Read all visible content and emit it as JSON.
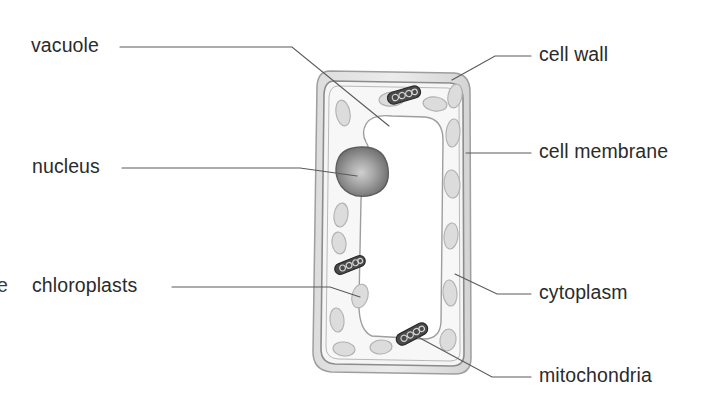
{
  "figure": {
    "style": "hand-drawn pencil biology diagram, grayscale",
    "background_color": "#ffffff",
    "text_color": "#2b2b2b",
    "line_color": "#5a5a5a"
  },
  "clipped_text": {
    "left_edge_fragment": "e"
  },
  "labels": [
    {
      "id": "vacuole",
      "text": "vacuole",
      "side": "left",
      "x": 31,
      "y": 36,
      "leader_from": [
        120,
        47
      ],
      "leader_to": [
        389,
        126
      ]
    },
    {
      "id": "nucleus",
      "text": "nucleus",
      "side": "left",
      "x": 32,
      "y": 157,
      "leader_from": [
        122,
        168
      ],
      "leader_to": [
        352,
        172
      ]
    },
    {
      "id": "chloroplasts",
      "text": "chloroplasts",
      "side": "left",
      "x": 32,
      "y": 276,
      "leader_from": [
        172,
        287
      ],
      "leader_to": [
        360,
        297
      ]
    },
    {
      "id": "cell-wall",
      "text": "cell wall",
      "side": "right",
      "x": 539,
      "y": 45,
      "leader_from": [
        531,
        56
      ],
      "leader_to": [
        455,
        78
      ]
    },
    {
      "id": "cell-membrane",
      "text": "cell membrane",
      "side": "right",
      "x": 539,
      "y": 142,
      "leader_from": [
        531,
        153
      ],
      "leader_to": [
        466,
        153
      ]
    },
    {
      "id": "cytoplasm",
      "text": "cytoplasm",
      "side": "right",
      "x": 539,
      "y": 283,
      "leader_from": [
        531,
        294
      ],
      "leader_to": [
        455,
        274
      ]
    },
    {
      "id": "mitochondria",
      "text": "mitochondria",
      "side": "right",
      "x": 539,
      "y": 366,
      "leader_from": [
        531,
        377
      ],
      "leader_to": [
        418,
        336
      ]
    }
  ],
  "cell": {
    "bounds": {
      "x": 316,
      "y": 70,
      "width": 156,
      "height": 304
    },
    "wall_color": "#d8d8d8",
    "wall_fill": "#e6e6e6",
    "cytoplasm_color": "#f4f4f4",
    "membrane_color": "#8c8c8c"
  },
  "organelles": {
    "vacuole": {
      "fill": "#ffffff",
      "stroke": "#9a9a9a"
    },
    "nucleus": {
      "cx": 362,
      "cy": 171,
      "rx": 25,
      "ry": 24,
      "fill_dark": "#6e6e6e",
      "fill_light": "#c2c2c2"
    },
    "chloroplast": {
      "fill": "#dcdcdc",
      "stroke": "#b4b4b4",
      "count": 14
    },
    "mitochondrion": {
      "fill": "#4a4a4a",
      "stroke": "#2e2e2e",
      "count": 3
    }
  }
}
